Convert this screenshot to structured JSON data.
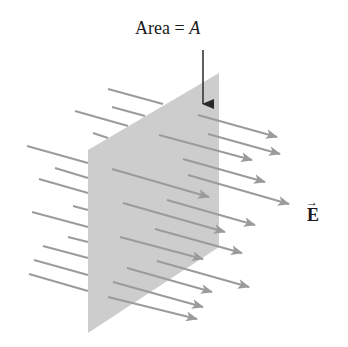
{
  "diagram": {
    "area_label": {
      "prefix": "Area = ",
      "variable": "A"
    },
    "field_label": {
      "symbol": "E",
      "vector_mark": "→"
    },
    "colors": {
      "plane": "#cdcdcd",
      "field_lines": "#9b9b9b",
      "pointer": "#2a2a2a",
      "text": "#1a1a1a"
    },
    "plane": {
      "vertices": [
        [
          88,
          150
        ],
        [
          219,
          73
        ],
        [
          219,
          247
        ],
        [
          88,
          333
        ]
      ]
    },
    "pointer_arrow": {
      "from": [
        203,
        50
      ],
      "to": [
        203,
        104
      ]
    },
    "field_lines_behind": [
      [
        [
          108,
          89
        ],
        [
          163,
          104
        ]
      ],
      [
        [
          112,
          107
        ],
        [
          145,
          116
        ]
      ],
      [
        [
          75,
          111
        ],
        [
          128,
          126
        ]
      ],
      [
        [
          93,
          133
        ],
        [
          108,
          138
        ]
      ],
      [
        [
          27,
          146
        ],
        [
          88,
          163
        ]
      ],
      [
        [
          55,
          168
        ],
        [
          88,
          178
        ]
      ],
      [
        [
          39,
          179
        ],
        [
          88,
          193
        ]
      ],
      [
        [
          73,
          206
        ],
        [
          88,
          210
        ]
      ],
      [
        [
          32,
          212
        ],
        [
          88,
          227
        ]
      ],
      [
        [
          68,
          237
        ],
        [
          88,
          242
        ]
      ],
      [
        [
          43,
          246
        ],
        [
          88,
          258
        ]
      ],
      [
        [
          34,
          260
        ],
        [
          88,
          275
        ]
      ],
      [
        [
          29,
          274
        ],
        [
          88,
          291
        ]
      ]
    ],
    "field_arrows_front": [
      [
        [
          198,
          115
        ],
        [
          277,
          137
        ]
      ],
      [
        [
          208,
          134
        ],
        [
          280,
          154
        ]
      ],
      [
        [
          159,
          135
        ],
        [
          252,
          160
        ]
      ],
      [
        [
          183,
          159
        ],
        [
          265,
          182
        ]
      ],
      [
        [
          188,
          175
        ],
        [
          289,
          204
        ]
      ],
      [
        [
          112,
          169
        ],
        [
          209,
          197
        ]
      ],
      [
        [
          167,
          200
        ],
        [
          255,
          225
        ]
      ],
      [
        [
          123,
          203
        ],
        [
          225,
          232
        ]
      ],
      [
        [
          155,
          229
        ],
        [
          242,
          253
        ]
      ],
      [
        [
          120,
          237
        ],
        [
          203,
          259
        ]
      ],
      [
        [
          157,
          261
        ],
        [
          249,
          287
        ]
      ],
      [
        [
          127,
          268
        ],
        [
          212,
          292
        ]
      ],
      [
        [
          113,
          282
        ],
        [
          203,
          307
        ]
      ],
      [
        [
          108,
          297
        ],
        [
          197,
          319
        ]
      ]
    ]
  }
}
